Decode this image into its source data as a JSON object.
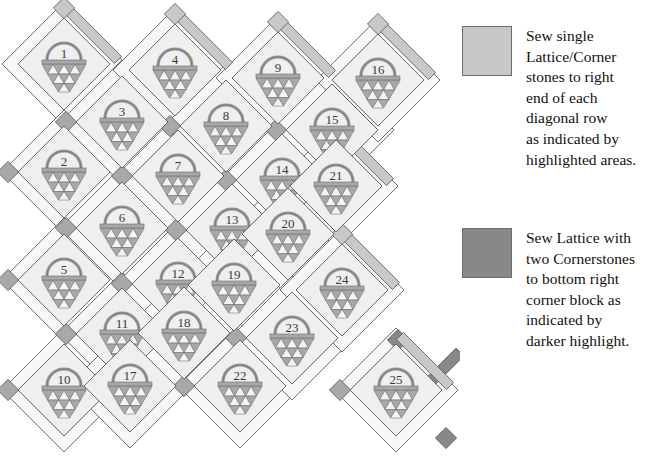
{
  "colors": {
    "background": "#ffffff",
    "block_fill": "#efefef",
    "sashing_fill": "#f7f7f7",
    "setting_triangle_fill": "#fbfbfb",
    "basket_gray": "#a8a8a8",
    "outline": "#5a5a5a",
    "highlight_light": "#c8c8c8",
    "highlight_dark": "#888888",
    "text": "#111111"
  },
  "legend": {
    "items": [
      {
        "swatch_name": "light-highlight-swatch",
        "swatch_color": "#c8c8c8",
        "text": "Sew single\nLattice/Corner\nstones to right\nend of each\ndiagonal row\nas indicated by\nhighlighted areas."
      },
      {
        "swatch_name": "dark-highlight-swatch",
        "swatch_color": "#888888",
        "text": "Sew Lattice with\ntwo Cornerstones\nto bottom right\ncorner block as\nindicated by\ndarker highlight."
      }
    ]
  },
  "quilt": {
    "rows": 5,
    "cols": 5,
    "block_count": 25,
    "origin": {
      "x": 64,
      "y": 64
    },
    "step_down": 108,
    "step_right": 56,
    "step_right_down": 54,
    "half": 52,
    "blocks": [
      {
        "label": "1",
        "col": 0,
        "row": 0,
        "cx": 64,
        "cy": 64,
        "highlight": "light"
      },
      {
        "label": "2",
        "col": 0,
        "row": 1,
        "cx": 64,
        "cy": 172,
        "highlight": "none"
      },
      {
        "label": "3",
        "col": 1,
        "row": 0,
        "cx": 122,
        "cy": 122,
        "highlight": "none"
      },
      {
        "label": "4",
        "col": 1,
        "row": -1,
        "cx": 175,
        "cy": 70,
        "highlight": "light"
      },
      {
        "label": "5",
        "col": 0,
        "row": 2,
        "cx": 64,
        "cy": 280,
        "highlight": "none"
      },
      {
        "label": "6",
        "col": 1,
        "row": 1,
        "cx": 122,
        "cy": 228,
        "highlight": "none"
      },
      {
        "label": "7",
        "col": 2,
        "row": 0,
        "cx": 178,
        "cy": 176,
        "highlight": "none"
      },
      {
        "label": "8",
        "col": 2,
        "row": -1,
        "cx": 226,
        "cy": 126,
        "highlight": "none"
      },
      {
        "label": "9",
        "col": 3,
        "row": -2,
        "cx": 278,
        "cy": 78,
        "highlight": "light"
      },
      {
        "label": "10",
        "col": 0,
        "row": 3,
        "cx": 64,
        "cy": 390,
        "highlight": "none"
      },
      {
        "label": "11",
        "col": 1,
        "row": 2,
        "cx": 122,
        "cy": 334,
        "highlight": "none"
      },
      {
        "label": "12",
        "col": 2,
        "row": 1,
        "cx": 178,
        "cy": 284,
        "highlight": "none"
      },
      {
        "label": "13",
        "col": 3,
        "row": 0,
        "cx": 232,
        "cy": 230,
        "highlight": "none"
      },
      {
        "label": "14",
        "col": 4,
        "row": -1,
        "cx": 282,
        "cy": 180,
        "highlight": "none"
      },
      {
        "label": "15",
        "col": 4,
        "row": -2,
        "cx": 332,
        "cy": 130,
        "highlight": "none"
      },
      {
        "label": "16",
        "col": 5,
        "row": -3,
        "cx": 378,
        "cy": 80,
        "highlight": "light"
      },
      {
        "label": "17",
        "col": 1,
        "row": 3,
        "cx": 130,
        "cy": 386,
        "highlight": "none"
      },
      {
        "label": "18",
        "col": 2,
        "row": 2,
        "cx": 184,
        "cy": 333,
        "highlight": "none"
      },
      {
        "label": "19",
        "col": 3,
        "row": 1,
        "cx": 234,
        "cy": 285,
        "highlight": "none"
      },
      {
        "label": "20",
        "col": 4,
        "row": 0,
        "cx": 288,
        "cy": 234,
        "highlight": "none"
      },
      {
        "label": "21",
        "col": 5,
        "row": -1,
        "cx": 336,
        "cy": 186,
        "highlight": "light"
      },
      {
        "label": "22",
        "col": 2,
        "row": 3,
        "cx": 240,
        "cy": 386,
        "highlight": "none"
      },
      {
        "label": "23",
        "col": 3,
        "row": 2,
        "cx": 292,
        "cy": 338,
        "highlight": "none"
      },
      {
        "label": "24",
        "col": 4,
        "row": 1,
        "cx": 342,
        "cy": 290,
        "highlight": "light"
      },
      {
        "label": "25",
        "col": 5,
        "row": 0,
        "cx": 396,
        "cy": 390,
        "highlight": "dark"
      }
    ]
  }
}
